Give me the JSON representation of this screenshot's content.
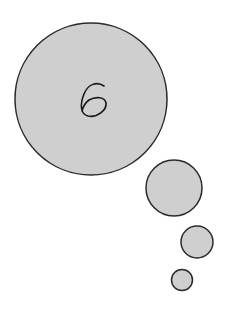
{
  "diagram": {
    "type": "thought-bubble",
    "fill_color": "#cfcfcf",
    "stroke_color": "#2a2a2a",
    "main_bubble": {
      "label": "6",
      "cx": 91,
      "cy": 99,
      "r": 76
    },
    "trail_bubbles": [
      {
        "cx": 174,
        "cy": 188,
        "r": 28
      },
      {
        "cx": 197,
        "cy": 242,
        "r": 16
      },
      {
        "cx": 182,
        "cy": 280,
        "r": 10.5
      }
    ]
  }
}
